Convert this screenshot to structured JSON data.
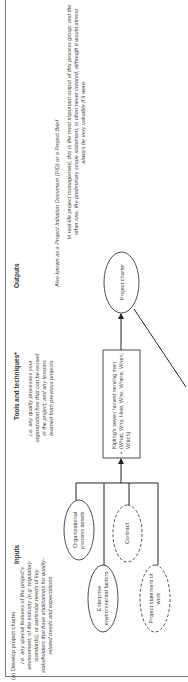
{
  "section_label": "(a) Develop project charter",
  "columns": {
    "inputs": {
      "heading": "Inputs",
      "note": "i.e. any special features of the project's environment, of the industry (e.g. regulatory standards), or particular needs of key stakeholders that have implications for quality-related needs and expectations"
    },
    "tools": {
      "heading": "Tools and techniques*",
      "note": "i.e. any quality processes your organization has that can be reused in the project; and any lessons learned from previous projects"
    },
    "outputs": {
      "heading": "Outputs",
      "note1": "Also known as a Project Initiation Document (PID) or a Project Brief",
      "note2": "In real-life project management, this is the most important output of this process group, and the other one, the preliminary scope statement, is often never created, although it would almost always be very valuable if it were."
    }
  },
  "nodes": {
    "org_assets": "Organizational process assets",
    "enterprise": "Enterprise environmental factors",
    "contract": "Contract",
    "sow": "Project statement of work",
    "kipling": "Kipling's seven honest serving men (What, Why, How, Who, Where, When, Which)",
    "charter": "Project charter"
  },
  "colors": {
    "line": "#222222",
    "text": "#444444",
    "frame": "#777777"
  }
}
